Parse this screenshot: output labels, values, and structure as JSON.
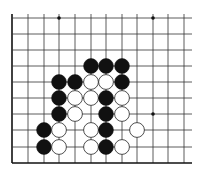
{
  "board": {
    "type": "go-board-fragment",
    "colors": {
      "background": "#ffffff",
      "line": "#333333",
      "edge": "#111111",
      "black_stone": "#111111",
      "white_stone": "#ffffff",
      "white_outline": "#222222"
    },
    "columns_x": [
      12,
      28,
      44,
      59,
      75,
      91,
      106,
      122,
      137,
      153,
      168,
      184
    ],
    "rows_y": [
      18,
      34,
      50,
      66,
      82,
      98,
      114,
      130,
      147,
      163
    ],
    "line_right_end": 192,
    "edges": [
      "left",
      "bottom"
    ],
    "star_points": [
      {
        "col": 3,
        "row": 0
      },
      {
        "col": 9,
        "row": 0
      },
      {
        "col": 9,
        "row": 6
      }
    ],
    "stones": [
      {
        "color": "black",
        "col": 5,
        "row": 3
      },
      {
        "color": "black",
        "col": 6,
        "row": 3
      },
      {
        "color": "black",
        "col": 7,
        "row": 3
      },
      {
        "color": "black",
        "col": 3,
        "row": 4
      },
      {
        "color": "black",
        "col": 4,
        "row": 4
      },
      {
        "color": "white",
        "col": 5,
        "row": 4
      },
      {
        "color": "white",
        "col": 6,
        "row": 4
      },
      {
        "color": "black",
        "col": 7,
        "row": 4
      },
      {
        "color": "black",
        "col": 3,
        "row": 5
      },
      {
        "color": "white",
        "col": 4,
        "row": 5
      },
      {
        "color": "white",
        "col": 5,
        "row": 5
      },
      {
        "color": "black",
        "col": 6,
        "row": 5
      },
      {
        "color": "white",
        "col": 7,
        "row": 5
      },
      {
        "color": "black",
        "col": 3,
        "row": 6
      },
      {
        "color": "white",
        "col": 4,
        "row": 6
      },
      {
        "color": "black",
        "col": 6,
        "row": 6
      },
      {
        "color": "white",
        "col": 7,
        "row": 6
      },
      {
        "color": "black",
        "col": 2,
        "row": 7
      },
      {
        "color": "white",
        "col": 3,
        "row": 7
      },
      {
        "color": "white",
        "col": 5,
        "row": 7
      },
      {
        "color": "black",
        "col": 6,
        "row": 7
      },
      {
        "color": "white",
        "col": 8,
        "row": 7
      },
      {
        "color": "black",
        "col": 2,
        "row": 8
      },
      {
        "color": "white",
        "col": 3,
        "row": 8
      },
      {
        "color": "white",
        "col": 5,
        "row": 8
      },
      {
        "color": "black",
        "col": 6,
        "row": 8
      },
      {
        "color": "white",
        "col": 7,
        "row": 8
      }
    ],
    "stone_radius": 7.4
  }
}
